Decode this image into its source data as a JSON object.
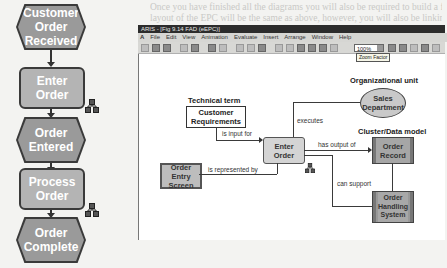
{
  "background_text": {
    "lines": [
      "Once you have finished all the diagrams you will also be required to build a final EPC. The",
      "layout of the EPC will be the same as above, however, you will also be linking the"
    ],
    "body_fragments": [
      "TCP-Tool Components",
      "ARIS - to begin with, a general overview of",
      "EPC will then be created for managing the",
      "ability to interpret the diagrams shown",
      "Flow / Data Components",
      "Event Shape"
    ]
  },
  "epc_chain": {
    "nodes": [
      {
        "type": "event",
        "label_lines": [
          "Customer",
          "Order",
          "Received"
        ]
      },
      {
        "type": "function",
        "label_lines": [
          "Enter",
          "Order"
        ]
      },
      {
        "type": "event",
        "label_lines": [
          "Order",
          "Entered"
        ]
      },
      {
        "type": "function",
        "label_lines": [
          "Process",
          "Order"
        ]
      },
      {
        "type": "event",
        "label_lines": [
          "Order",
          "Complete"
        ]
      }
    ],
    "colors": {
      "event_fill": "#9a9a9a",
      "function_fill": "#b4b4b4",
      "border": "#3a3a3a"
    }
  },
  "window": {
    "title": "ARIS - [Fig 9.14 FAD (eEPC)]",
    "menu": [
      "File",
      "Edit",
      "View",
      "Animation",
      "Evaluate",
      "Insert",
      "Arrange",
      "Window",
      "Help"
    ],
    "zoom_value": "100%",
    "zoom_tooltip": "Zoom Factor"
  },
  "diagram": {
    "technical_term_heading": "Technical term",
    "technical_term_lines": [
      "Customer",
      "Requirements"
    ],
    "org_unit_heading": "Organizational unit",
    "org_unit_lines": [
      "Sales",
      "Department"
    ],
    "cluster_heading": "Cluster/Data model",
    "cluster_lines": [
      "Order",
      "Record"
    ],
    "function_lines": [
      "Enter",
      "Order"
    ],
    "screen_lines": [
      "Order Entry",
      "Screen"
    ],
    "system_lines": [
      "Order",
      "Handling",
      "System"
    ],
    "edges": {
      "is_input_for": "is input for",
      "executes": "executes",
      "has_output_of": "has output of",
      "is_represented_by": "is represented by",
      "can_support": "can support"
    }
  }
}
